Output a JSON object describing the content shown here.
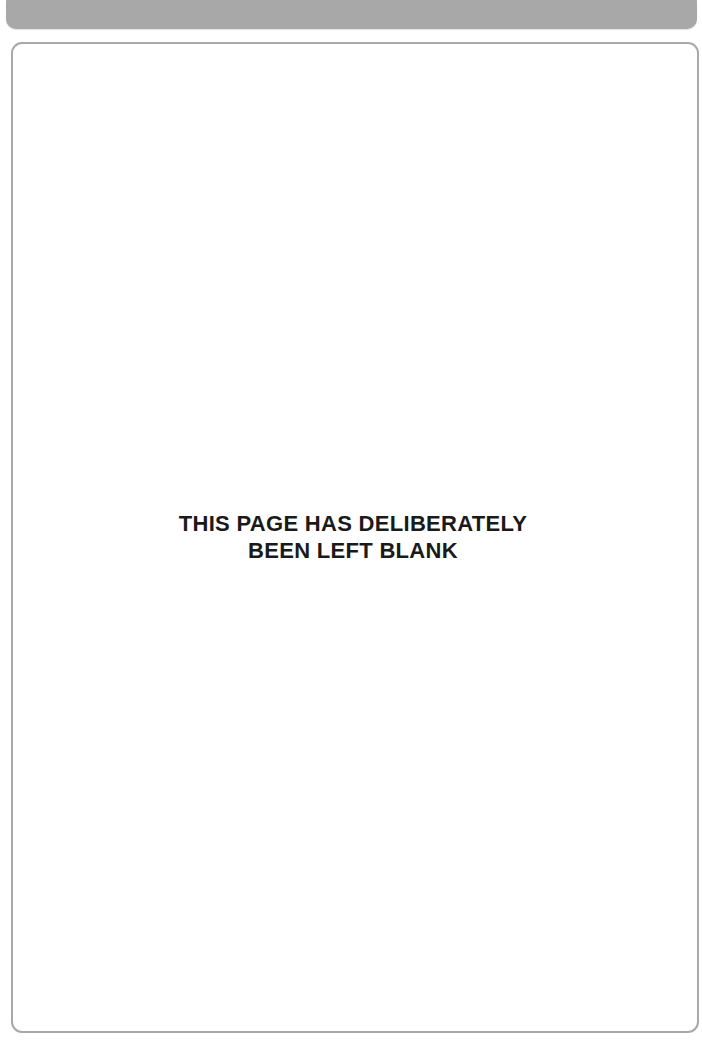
{
  "page": {
    "header_bar_color": "#a8a8a8",
    "frame_border_color": "#a9a9a9",
    "notice": {
      "lines": [
        "THIS PAGE HAS DELIBERATELY",
        "BEEN LEFT BLANK"
      ],
      "color": "#1a1a1a"
    }
  }
}
